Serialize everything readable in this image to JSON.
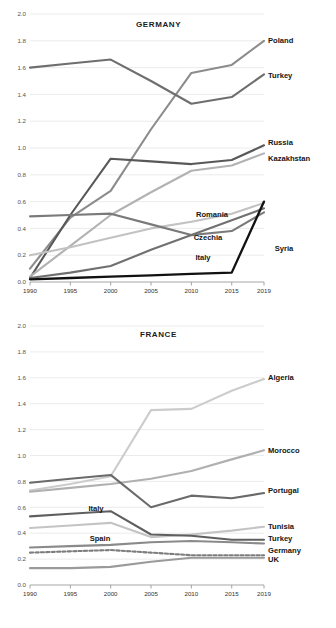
{
  "figure": {
    "top_partial_caption": "",
    "background": "#ffffff"
  },
  "chart_data": [
    {
      "id": "germany",
      "type": "line",
      "title": "GERMANY",
      "xlabel": "",
      "ylabel": "",
      "x": [
        1990,
        1995,
        2000,
        2005,
        2010,
        2015,
        2019
      ],
      "xticklabels": [
        "1990",
        "1995",
        "2000",
        "2005",
        "2010",
        "2015",
        "2019"
      ],
      "xlim": [
        1990,
        2019
      ],
      "ylim": [
        0.0,
        2.0
      ],
      "yticks": [
        0.0,
        0.2,
        0.4,
        0.6,
        0.8,
        1.0,
        1.2,
        1.4,
        1.6,
        1.8,
        2.0
      ],
      "yticklabels": [
        "0.0",
        "0.2",
        "0.4",
        "0.6",
        "0.8",
        "1.0",
        "1.2",
        "1.4",
        "1.6",
        "1.8",
        "2.0"
      ],
      "grid": true,
      "legend_position": "right-of-line-end",
      "series": [
        {
          "name": "Poland",
          "color": "#8c8c8c",
          "width": 2.1,
          "dash": "none",
          "label_y": 1.8,
          "values": [
            0.1,
            0.48,
            0.68,
            1.14,
            1.56,
            1.62,
            1.8
          ]
        },
        {
          "name": "Turkey",
          "color": "#6e6e6e",
          "width": 2.1,
          "dash": "none",
          "label_y": 1.54,
          "values": [
            1.6,
            1.63,
            1.66,
            1.5,
            1.33,
            1.38,
            1.55
          ]
        },
        {
          "name": "Russia",
          "color": "#585858",
          "width": 2.1,
          "dash": "none",
          "label_y": 1.04,
          "values": [
            0.03,
            0.5,
            0.92,
            0.9,
            0.88,
            0.91,
            1.02
          ]
        },
        {
          "name": "Kazakhstan",
          "color": "#b2b2b2",
          "width": 2.1,
          "dash": "none",
          "label_y": 0.92,
          "values": [
            0.04,
            0.27,
            0.5,
            0.67,
            0.83,
            0.87,
            0.96
          ]
        },
        {
          "name": "Romania",
          "color": "#c2c2c2",
          "width": 2.1,
          "dash": "none",
          "label_y": 0.58,
          "values": [
            0.2,
            0.26,
            0.33,
            0.4,
            0.45,
            0.51,
            0.59
          ]
        },
        {
          "name": "Czechia",
          "color": "#7a7a7a",
          "width": 2.1,
          "dash": "none",
          "label_y": 0.44,
          "values": [
            0.49,
            0.5,
            0.51,
            0.43,
            0.35,
            0.38,
            0.52
          ]
        },
        {
          "name": "Italy",
          "color": "#707070",
          "width": 2.1,
          "dash": "none",
          "label_y": 0.3,
          "values": [
            0.03,
            0.07,
            0.12,
            0.24,
            0.35,
            0.46,
            0.55
          ]
        },
        {
          "name": "Syria",
          "color": "#111111",
          "width": 2.3,
          "dash": "none",
          "label_y": 0.33,
          "values": [
            0.02,
            0.03,
            0.04,
            0.05,
            0.06,
            0.07,
            0.6
          ]
        }
      ]
    },
    {
      "id": "france",
      "type": "line",
      "title": "FRANCE",
      "xlabel": "",
      "ylabel": "",
      "x": [
        1990,
        1995,
        2000,
        2005,
        2010,
        2015,
        2019
      ],
      "xticklabels": [
        "1990",
        "1995",
        "2000",
        "2005",
        "2010",
        "2015",
        "2019"
      ],
      "xlim": [
        1990,
        2019
      ],
      "ylim": [
        0.0,
        2.0
      ],
      "yticks": [
        0.0,
        0.2,
        0.4,
        0.6,
        0.8,
        1.0,
        1.2,
        1.4,
        1.6,
        1.8,
        2.0
      ],
      "yticklabels": [
        "0.0",
        "0.2",
        "0.4",
        "0.6",
        "0.8",
        "1.0",
        "1.2",
        "1.4",
        "1.6",
        "1.8",
        "2.0"
      ],
      "grid": true,
      "legend_position": "right-of-line-end",
      "series": [
        {
          "name": "Algeria",
          "color": "#cccccc",
          "width": 2.1,
          "dash": "none",
          "label_y": 1.6,
          "values": [
            0.73,
            0.78,
            0.84,
            1.35,
            1.36,
            1.5,
            1.59
          ]
        },
        {
          "name": "Morocco",
          "color": "#b0b0b0",
          "width": 2.1,
          "dash": "none",
          "label_y": 1.04,
          "values": [
            0.72,
            0.75,
            0.78,
            0.82,
            0.88,
            0.97,
            1.04
          ]
        },
        {
          "name": "Portugal",
          "color": "#6a6a6a",
          "width": 2.1,
          "dash": "none",
          "label_y": 0.73,
          "values": [
            0.79,
            0.82,
            0.85,
            0.6,
            0.69,
            0.67,
            0.71
          ]
        },
        {
          "name": "Tunisia",
          "color": "#c4c4c4",
          "width": 2.1,
          "dash": "none",
          "label_y": 0.45,
          "values": [
            0.44,
            0.46,
            0.48,
            0.37,
            0.39,
            0.42,
            0.45
          ]
        },
        {
          "name": "Turkey",
          "color": "#5f5f5f",
          "width": 2.1,
          "dash": "none",
          "label_y": 0.36,
          "values": [
            0.53,
            0.55,
            0.57,
            0.39,
            0.38,
            0.35,
            0.35
          ]
        },
        {
          "name": "Germany",
          "color": "#7d7d7d",
          "width": 2.1,
          "dash": "dashed",
          "label_y": 0.27,
          "values": [
            0.25,
            0.26,
            0.27,
            0.25,
            0.23,
            0.23,
            0.23
          ]
        },
        {
          "name": "UK",
          "color": "#8a8a8a",
          "width": 2.1,
          "dash": "none",
          "label_y": 0.2,
          "values": [
            0.29,
            0.3,
            0.31,
            0.33,
            0.34,
            0.33,
            0.32
          ]
        },
        {
          "name": "Spain",
          "color": "#9a9a9a",
          "width": 2.1,
          "dash": "none",
          "label_y": 0.47,
          "values": [
            0.13,
            0.13,
            0.14,
            0.18,
            0.21,
            0.21,
            0.21
          ]
        }
      ],
      "inline_labels": [
        {
          "name": "Italy",
          "x": 2000,
          "y": 0.62
        },
        {
          "name": "Spain",
          "x": 2000,
          "y": 0.48
        }
      ]
    }
  ]
}
